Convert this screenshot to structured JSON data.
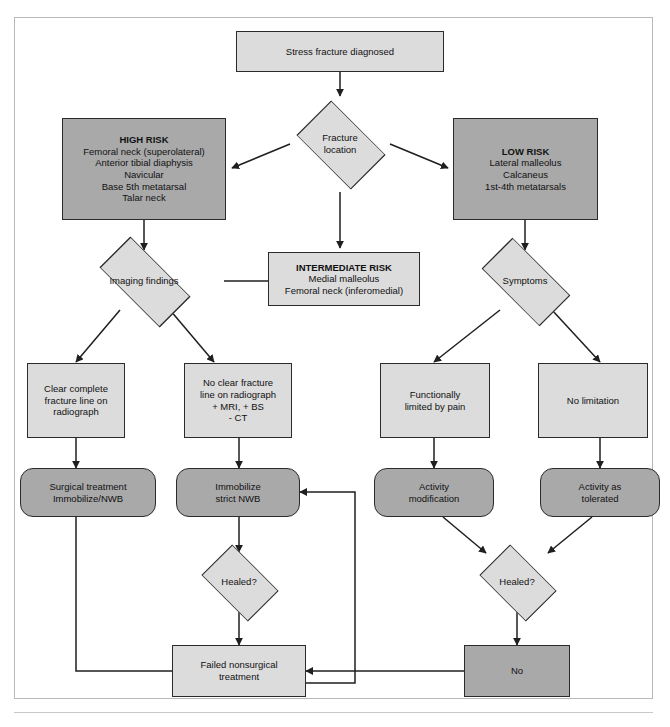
{
  "figure": {
    "caption": "",
    "colors": {
      "node_light": "#dcdcdc",
      "node_mid": "#d4d4d4",
      "node_dark": "#a9a9a9",
      "stroke": "#2b2b2b",
      "frame": "#b9b9b9",
      "background": "#ffffff"
    }
  },
  "nodes": {
    "start": {
      "id": "start",
      "shape": "rect",
      "label": "Stress fracture diagnosed",
      "lines": [
        "Stress fracture diagnosed"
      ]
    },
    "fracture_location": {
      "id": "fracture_location",
      "shape": "diamond",
      "label": "Fracture location",
      "lines": [
        "Fracture",
        "location"
      ]
    },
    "high_risk": {
      "id": "high_risk",
      "shape": "rect",
      "heading": "HIGH RISK",
      "lines": [
        "Femoral neck (superolateral)",
        "Anterior tibial diaphysis",
        "Navicular",
        "Base 5th metatarsal",
        "Talar neck"
      ]
    },
    "intermediate_risk": {
      "id": "intermediate_risk",
      "shape": "rect",
      "heading": "INTERMEDIATE RISK",
      "lines": [
        "Medial malleolus",
        "Femoral neck (inferomedial)"
      ]
    },
    "low_risk": {
      "id": "low_risk",
      "shape": "rect",
      "heading": "LOW RISK",
      "lines": [
        "Lateral malleolus",
        "Calcaneus",
        "1st-4th metatarsals"
      ]
    },
    "imaging_findings": {
      "id": "imaging_findings",
      "shape": "diamond",
      "label": "Imaging findings",
      "lines": [
        "Imaging findings"
      ]
    },
    "symptoms": {
      "id": "symptoms",
      "shape": "diamond",
      "label": "Symptoms",
      "lines": [
        "Symptoms"
      ]
    },
    "clear_fracture_line": {
      "id": "clear_fracture_line",
      "shape": "rect",
      "lines": [
        "Clear complete",
        "fracture line on",
        "radiograph"
      ]
    },
    "no_clear_fracture_line": {
      "id": "no_clear_fracture_line",
      "shape": "rect",
      "lines": [
        "No clear fracture",
        "line on radiograph",
        "+ MRI, + BS",
        "- CT"
      ]
    },
    "functionally_limited": {
      "id": "functionally_limited",
      "shape": "rect",
      "lines": [
        "Functionally",
        "limited by pain"
      ]
    },
    "no_limitation": {
      "id": "no_limitation",
      "shape": "rect",
      "lines": [
        "No limitation"
      ]
    },
    "surgical_treatment": {
      "id": "surgical_treatment",
      "shape": "rounded",
      "lines": [
        "Surgical treatment",
        "Immobilize/NWB"
      ]
    },
    "immobilize_strict_nwb": {
      "id": "immobilize_strict_nwb",
      "shape": "rounded",
      "lines": [
        "Immobilize",
        "strict NWB"
      ]
    },
    "activity_modification": {
      "id": "activity_modification",
      "shape": "rounded",
      "lines": [
        "Activity",
        "modification"
      ]
    },
    "activity_as_tolerated": {
      "id": "activity_as_tolerated",
      "shape": "rounded",
      "lines": [
        "Activity as",
        "tolerated"
      ]
    },
    "healed_left": {
      "id": "healed_left",
      "shape": "diamond",
      "label": "Healed?",
      "lines": [
        "Healed?"
      ]
    },
    "healed_right": {
      "id": "healed_right",
      "shape": "diamond",
      "label": "Healed?",
      "lines": [
        "Healed?"
      ]
    },
    "failed_nonsurgical": {
      "id": "failed_nonsurgical",
      "shape": "rect",
      "lines": [
        "Failed nonsurgical",
        "treatment"
      ]
    },
    "no_outcome": {
      "id": "no_outcome",
      "shape": "rect",
      "lines": [
        "No"
      ]
    }
  },
  "edges": [
    {
      "from": "start",
      "to": "fracture_location",
      "label": ""
    },
    {
      "from": "fracture_location",
      "to": "high_risk",
      "label": ""
    },
    {
      "from": "fracture_location",
      "to": "intermediate_risk",
      "label": ""
    },
    {
      "from": "fracture_location",
      "to": "low_risk",
      "label": ""
    },
    {
      "from": "high_risk",
      "to": "imaging_findings",
      "label": ""
    },
    {
      "from": "intermediate_risk",
      "to": "imaging_findings",
      "label": ""
    },
    {
      "from": "low_risk",
      "to": "symptoms",
      "label": ""
    },
    {
      "from": "imaging_findings",
      "to": "clear_fracture_line",
      "label": ""
    },
    {
      "from": "imaging_findings",
      "to": "no_clear_fracture_line",
      "label": ""
    },
    {
      "from": "symptoms",
      "to": "functionally_limited",
      "label": ""
    },
    {
      "from": "symptoms",
      "to": "no_limitation",
      "label": ""
    },
    {
      "from": "clear_fracture_line",
      "to": "surgical_treatment",
      "label": ""
    },
    {
      "from": "no_clear_fracture_line",
      "to": "immobilize_strict_nwb",
      "label": ""
    },
    {
      "from": "functionally_limited",
      "to": "activity_modification",
      "label": ""
    },
    {
      "from": "no_limitation",
      "to": "activity_as_tolerated",
      "label": ""
    },
    {
      "from": "immobilize_strict_nwb",
      "to": "healed_left",
      "label": ""
    },
    {
      "from": "activity_modification",
      "to": "healed_right",
      "label": ""
    },
    {
      "from": "activity_as_tolerated",
      "to": "healed_right",
      "label": ""
    },
    {
      "from": "healed_left",
      "to": "failed_nonsurgical",
      "label": ""
    },
    {
      "from": "healed_right",
      "to": "no_outcome",
      "label": ""
    },
    {
      "from": "no_outcome",
      "to": "failed_nonsurgical",
      "label": ""
    },
    {
      "from": "failed_nonsurgical",
      "to": "surgical_treatment",
      "label": ""
    },
    {
      "from": "failed_nonsurgical",
      "to": "immobilize_strict_nwb",
      "label": ""
    }
  ]
}
